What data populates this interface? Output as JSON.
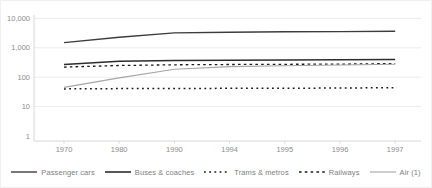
{
  "chart_data": {
    "type": "line",
    "title": "",
    "xlabel": "",
    "ylabel": "",
    "y_scale": "log",
    "ylim": [
      1,
      10000
    ],
    "grid": "horizontal",
    "legend_position": "bottom",
    "categories": [
      "1970",
      "1980",
      "1990",
      "1994",
      "1995",
      "1996",
      "1997"
    ],
    "y_ticks": [
      {
        "value": 10000,
        "label": "10,000"
      },
      {
        "value": 1000,
        "label": "1,000"
      },
      {
        "value": 100,
        "label": "100"
      },
      {
        "value": 10,
        "label": "10"
      },
      {
        "value": 1,
        "label": "1"
      }
    ],
    "series": [
      {
        "name": "Passenger cars",
        "values": [
          1500,
          2300,
          3200,
          3400,
          3500,
          3550,
          3650
        ],
        "color": "#3d3d3d",
        "style": "solid",
        "width": 1.4,
        "dash": ""
      },
      {
        "name": "Buses & coaches",
        "values": [
          270,
          350,
          370,
          380,
          385,
          390,
          400
        ],
        "color": "#2d2d2d",
        "style": "solid",
        "width": 1.6,
        "dash": ""
      },
      {
        "name": "Trams & metros",
        "values": [
          40,
          41,
          41,
          42,
          42,
          43,
          44
        ],
        "color": "#1a1a1a",
        "style": "dotted",
        "width": 1.5,
        "dash": "1.8 3.4"
      },
      {
        "name": "Railways",
        "values": [
          220,
          250,
          265,
          270,
          275,
          280,
          290
        ],
        "color": "#1a1a1a",
        "style": "dotted",
        "width": 1.3,
        "dash": "2.6 3.2"
      },
      {
        "name": "Air (1)",
        "values": [
          45,
          95,
          185,
          230,
          245,
          260,
          275
        ],
        "color": "#a6a6a6",
        "style": "solid",
        "width": 1.1,
        "dash": ""
      }
    ]
  },
  "colors": {
    "background": "#ffffff",
    "gridline": "#ececec",
    "axis": "#d8d8d8",
    "tick_text": "#8c8c8c",
    "legend_text": "#7e7e7e"
  }
}
